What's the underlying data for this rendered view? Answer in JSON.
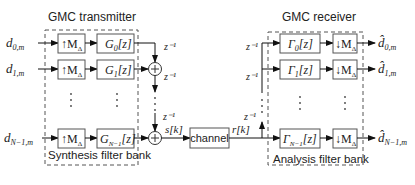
{
  "transmitter": {
    "title": "GMC transmitter",
    "bank_label": "Synthesis filter bank",
    "inputs": [
      {
        "sym": "d",
        "sub": "0,m"
      },
      {
        "sym": "d",
        "sub": "1,m"
      },
      {
        "sym": "d",
        "sub": "N−1,m"
      }
    ],
    "upsamplers": [
      {
        "label": "↑M",
        "sub": "Δ"
      },
      {
        "label": "↑M",
        "sub": "Δ"
      },
      {
        "label": "↑M",
        "sub": "Δ"
      }
    ],
    "filters": [
      {
        "sym": "G",
        "sub": "0",
        "arg": "[z]"
      },
      {
        "sym": "G",
        "sub": "1",
        "arg": "[z]"
      },
      {
        "sym": "G",
        "sub": "N−1",
        "arg": "[z]"
      }
    ],
    "delays": [
      "z⁻¹",
      "z⁻¹",
      "z⁻¹"
    ],
    "output_signal": "s[k]",
    "ellipsis": "⋮"
  },
  "channel": {
    "label": "channel",
    "output_signal": "r[k]"
  },
  "receiver": {
    "title": "GMC receiver",
    "bank_label": "Analysis filter bank",
    "delays": [
      "z⁻¹",
      "z⁻¹",
      "z⁻¹"
    ],
    "filters": [
      {
        "sym": "Γ",
        "sub": "0",
        "arg": "[z]"
      },
      {
        "sym": "Γ",
        "sub": "1",
        "arg": "[z]"
      },
      {
        "sym": "Γ",
        "sub": "N−1",
        "arg": "[z]"
      }
    ],
    "downsamplers": [
      {
        "label": "↓M",
        "sub": "Δ"
      },
      {
        "label": "↓M",
        "sub": "Δ"
      },
      {
        "label": "↓M",
        "sub": "Δ"
      }
    ],
    "outputs": [
      {
        "sym": "d̂",
        "sub": "0,m"
      },
      {
        "sym": "d̂",
        "sub": "1,m"
      },
      {
        "sym": "d̂",
        "sub": "N−1,m"
      }
    ],
    "ellipsis": "⋮"
  },
  "adder_symbol": "+"
}
